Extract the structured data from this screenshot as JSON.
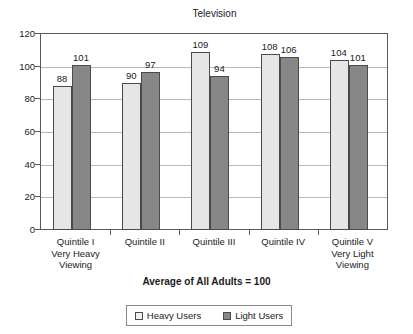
{
  "chart_data": {
    "type": "bar",
    "title": "Television",
    "subtitle": "Average of All Adults = 100",
    "xlabel": "",
    "ylabel": "",
    "ylim": [
      0,
      120
    ],
    "yticks": [
      0,
      20,
      40,
      60,
      80,
      100,
      120
    ],
    "grid": true,
    "legend_position": "bottom",
    "categories": [
      "Quintile I\nVery Heavy\nViewing",
      "Quintile II",
      "Quintile III",
      "Quintile IV",
      "Quintile V\nVery Light\nViewing"
    ],
    "category_lines": [
      [
        "Quintile I",
        "Very Heavy",
        "Viewing"
      ],
      [
        "Quintile II"
      ],
      [
        "Quintile III"
      ],
      [
        "Quintile IV"
      ],
      [
        "Quintile V",
        "Very Light",
        "Viewing"
      ]
    ],
    "series": [
      {
        "name": "Heavy Users",
        "color": "#e6e6e6",
        "values": [
          88,
          90,
          109,
          108,
          104
        ]
      },
      {
        "name": "Light Users",
        "color": "#878787",
        "values": [
          101,
          97,
          94,
          106,
          101
        ]
      }
    ]
  },
  "legend": {
    "items": [
      {
        "label": "Heavy Users"
      },
      {
        "label": "Light Users"
      }
    ]
  },
  "axis": {
    "y_tick_labels": [
      "120",
      "100",
      "80",
      "60",
      "40",
      "20",
      "0"
    ]
  },
  "colors": {
    "heavy_users": "#e6e6e6",
    "light_users": "#878787",
    "axis": "#5a5a5a",
    "gridline": "#b8b8b8",
    "text": "#1a1a1a",
    "background": "#ffffff"
  }
}
